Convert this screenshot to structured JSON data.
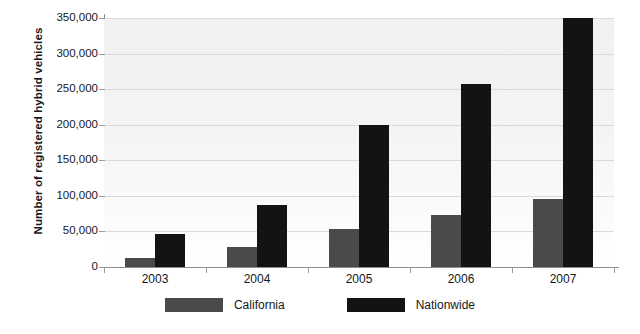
{
  "chart_data": {
    "type": "bar",
    "title": "",
    "subtitle": "",
    "xlabel": "",
    "ylabel": "Number of registered hybrid vehicles",
    "categories": [
      "2003",
      "2004",
      "2005",
      "2006",
      "2007"
    ],
    "series": [
      {
        "name": "California",
        "color": "#4a4a4a",
        "values": [
          13000,
          28000,
          53000,
          73000,
          95000
        ]
      },
      {
        "name": "Nationwide",
        "color": "#131313",
        "values": [
          46000,
          87000,
          200000,
          257000,
          350000
        ]
      }
    ],
    "ylim": [
      0,
      350000
    ],
    "ytick_values": [
      0,
      50000,
      100000,
      150000,
      200000,
      250000,
      300000,
      350000
    ],
    "ytick_labels": [
      "0",
      "50,000",
      "100,000",
      "150,000",
      "200,000",
      "250,000",
      "300,000",
      "350,000"
    ],
    "grid": true,
    "grid_axis": "y",
    "legend_position": "bottom",
    "plot_background": "#f2f2f2"
  },
  "legend": {
    "items": [
      {
        "label": "California",
        "swatch": "gray-swatch"
      },
      {
        "label": "Nationwide",
        "swatch": "black-swatch"
      }
    ]
  }
}
